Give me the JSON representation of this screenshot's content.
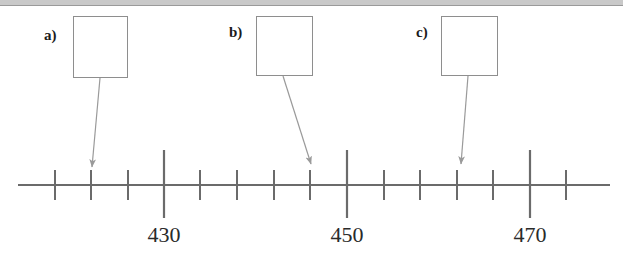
{
  "page": {
    "width": 623,
    "height": 268,
    "background_color": "#ffffff",
    "top_band_color": "#c9c9c9",
    "top_band_line_color": "#9a9a9a"
  },
  "figure": {
    "type": "number-line",
    "line_color": "#6b6b6b",
    "tick_color": "#6b6b6b",
    "arrow_color": "#9a9a9a",
    "box_border_color": "#8e8e8e"
  },
  "callouts": [
    {
      "id": "a",
      "label": "a)",
      "label_x": 44,
      "label_y": 28,
      "box_x": 73,
      "box_y": 16,
      "box_width": 55,
      "box_height": 62,
      "answer": "",
      "arrow": {
        "x1": 100,
        "y1": 78,
        "x2": 92,
        "y2": 167
      },
      "points_to_value": 426
    },
    {
      "id": "b",
      "label": "b)",
      "label_x": 229,
      "label_y": 25,
      "box_x": 256,
      "box_y": 16,
      "box_width": 57,
      "box_height": 60,
      "answer": "",
      "arrow": {
        "x1": 283,
        "y1": 76,
        "x2": 311,
        "y2": 164
      },
      "points_to_value": 448
    },
    {
      "id": "c",
      "label": "c)",
      "label_x": 416,
      "label_y": 25,
      "box_x": 441,
      "box_y": 16,
      "box_width": 57,
      "box_height": 60,
      "answer": "",
      "arrow": {
        "x1": 468,
        "y1": 76,
        "x2": 461,
        "y2": 164
      },
      "points_to_value": 462
    }
  ],
  "chart_data": {
    "type": "number-line",
    "title": "",
    "xlabel": "",
    "ylabel": "",
    "axis": {
      "line_y": 185,
      "line_x_start": 18,
      "line_x_end": 610,
      "value_start": 424,
      "value_end": 476,
      "value_step": 2,
      "minor_tick_top": 170,
      "minor_tick_bottom": 200,
      "major_tick_top": 150,
      "major_tick_bottom": 218
    },
    "ticks": [
      {
        "x": 55,
        "value": 424,
        "major": false,
        "label": ""
      },
      {
        "x": 91,
        "value": 426,
        "major": false,
        "label": ""
      },
      {
        "x": 128,
        "value": 428,
        "major": false,
        "label": ""
      },
      {
        "x": 164,
        "value": 430,
        "major": true,
        "label": "430"
      },
      {
        "x": 200,
        "value": 432,
        "major": false,
        "label": ""
      },
      {
        "x": 237,
        "value": 434,
        "major": false,
        "label": ""
      },
      {
        "x": 274,
        "value": 436,
        "major": false,
        "label": ""
      },
      {
        "x": 310,
        "value": 438,
        "major": false,
        "label": ""
      },
      {
        "x": 347,
        "value": 440,
        "major": true,
        "label": "450"
      },
      {
        "x": 384,
        "value": 442,
        "major": false,
        "label": ""
      },
      {
        "x": 420,
        "value": 444,
        "major": false,
        "label": ""
      },
      {
        "x": 457,
        "value": 446,
        "major": false,
        "label": ""
      },
      {
        "x": 493,
        "value": 448,
        "major": false,
        "label": ""
      },
      {
        "x": 530,
        "value": 450,
        "major": true,
        "label": "470"
      },
      {
        "x": 566,
        "value": 452,
        "major": false,
        "label": ""
      }
    ],
    "tick_labels": [
      {
        "x": 164,
        "y": 224,
        "text": "430"
      },
      {
        "x": 347,
        "y": 224,
        "text": "450"
      },
      {
        "x": 530,
        "y": 224,
        "text": "470"
      }
    ],
    "markers": [
      {
        "id": "a",
        "x": 92,
        "value": 426
      },
      {
        "id": "b",
        "x": 311,
        "value": 448
      },
      {
        "id": "c",
        "x": 461,
        "value": 462
      }
    ]
  }
}
